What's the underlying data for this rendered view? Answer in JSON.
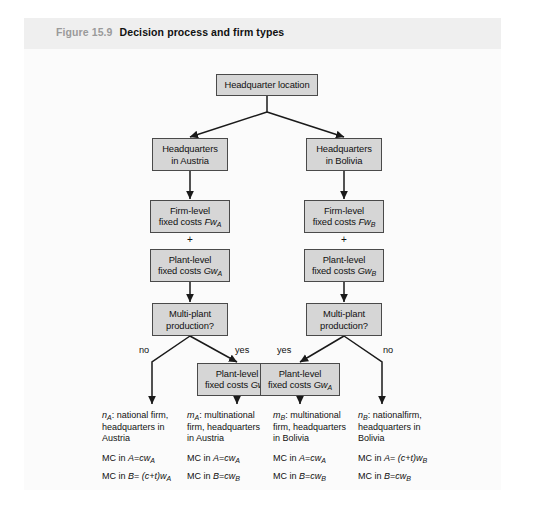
{
  "figure": {
    "number": "Figure 15.9",
    "title": "Decision process and firm types"
  },
  "nodes": {
    "root": {
      "line1": "Headquarter location"
    },
    "hq_austria": {
      "line1": "Headquarters",
      "line2": "in Austria"
    },
    "hq_bolivia": {
      "line1": "Headquarters",
      "line2": "in  Bolivia"
    },
    "firm_costs_a": {
      "line1": "Firm-level",
      "line2_pre": "fixed costs ",
      "line2_var": "Fw",
      "line2_sub": "A"
    },
    "firm_costs_b": {
      "line1": "Firm-level",
      "line2_pre": "fixed costs ",
      "line2_var": "Fw",
      "line2_sub": "B"
    },
    "plant_costs_a": {
      "line1": "Plant-level",
      "line2_pre": "fixed costs ",
      "line2_var": "Gw",
      "line2_sub": "A"
    },
    "plant_costs_b": {
      "line1": "Plant-level",
      "line2_pre": "fixed costs ",
      "line2_var": "Gw",
      "line2_sub": "B"
    },
    "multi_plant_left": {
      "line1": "Multi-plant",
      "line2": "production?"
    },
    "multi_plant_right": {
      "line1": "Multi-plant",
      "line2": "production?"
    },
    "plant_costs_gwb": {
      "line1": "Plant-level",
      "line2_pre": "fixed costs ",
      "line2_var": "Gw",
      "line2_sub": "B"
    },
    "plant_costs_gwa": {
      "line1": "Plant-level",
      "line2_pre": "fixed costs ",
      "line2_var": "Gw",
      "line2_sub": "A"
    }
  },
  "operators": {
    "plus_left": "+",
    "plus_right": "+"
  },
  "edge_labels": {
    "left_no": "no",
    "left_yes": "yes",
    "right_yes": "yes",
    "right_no": "no"
  },
  "outcomes": [
    {
      "symbol": "n",
      "symbol_sub": "A",
      "desc_line1": ": national firm,",
      "desc_line2": "headquarters in",
      "desc_line3": "Austria",
      "mc_a_pre": "MC in ",
      "mc_a_var": "A",
      "mc_a_eq": "=",
      "mc_a_val": "cw",
      "mc_a_sub": "A",
      "mc_b_pre": "MC in ",
      "mc_b_var": "B",
      "mc_b_eq": "= ",
      "mc_b_val": "(c+t)w",
      "mc_b_sub": "A"
    },
    {
      "symbol": "m",
      "symbol_sub": "A",
      "desc_line1": ": multinational",
      "desc_line2": "firm, headquarters",
      "desc_line3": "in  Austria",
      "mc_a_pre": "MC in ",
      "mc_a_var": "A",
      "mc_a_eq": "=",
      "mc_a_val": "cw",
      "mc_a_sub": "A",
      "mc_b_pre": "MC in ",
      "mc_b_var": "B",
      "mc_b_eq": "=",
      "mc_b_val": "cw",
      "mc_b_sub": "B"
    },
    {
      "symbol": "m",
      "symbol_sub": "B",
      "desc_line1": ": multinational",
      "desc_line2": "firm, headquarters",
      "desc_line3": "in  Bolivia",
      "mc_a_pre": "MC in ",
      "mc_a_var": "A",
      "mc_a_eq": "=",
      "mc_a_val": "cw",
      "mc_a_sub": "A",
      "mc_b_pre": "MC in ",
      "mc_b_var": "B",
      "mc_b_eq": "=",
      "mc_b_val": "cw",
      "mc_b_sub": "B"
    },
    {
      "symbol": "n",
      "symbol_sub": "B",
      "desc_line1": ": nationalfirm,",
      "desc_line2": "headquarters in",
      "desc_line3": "Bolivia",
      "mc_a_pre": "MC in ",
      "mc_a_var": "A",
      "mc_a_eq": "= ",
      "mc_a_val": "(c+t)w",
      "mc_a_sub": "B",
      "mc_b_pre": "MC in ",
      "mc_b_var": "B",
      "mc_b_eq": "=",
      "mc_b_val": "cw",
      "mc_b_sub": "B"
    }
  ],
  "colors": {
    "box_fill": "#d6d6d6",
    "box_border": "#4a4a4a",
    "header_bar": "#efefef",
    "caption_number": "#9a9a9a",
    "line": "#1a1a1a"
  }
}
